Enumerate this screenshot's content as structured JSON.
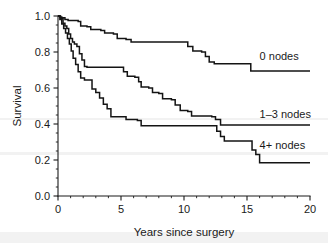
{
  "chart_data": {
    "type": "line",
    "subtype": "kaplan-meier-step",
    "title": "",
    "xlabel": "Years since surgery",
    "ylabel": "Survival",
    "xlim": [
      0,
      20
    ],
    "ylim": [
      0,
      1.0
    ],
    "grid": false,
    "legend_position": "inline-right",
    "x_ticks": [
      0,
      5,
      10,
      15,
      20
    ],
    "x_tick_labels": [
      "0",
      "5",
      "10",
      "15",
      "20"
    ],
    "x_minor_tick_interval": 1,
    "y_ticks": [
      0.0,
      0.2,
      0.4,
      0.6,
      0.8,
      1.0
    ],
    "y_tick_labels": [
      "0.0",
      "0.2",
      "0.4",
      "0.6",
      "0.8",
      "1.0"
    ],
    "y_minor_tick_interval": 0.05,
    "series": [
      {
        "name": "0 nodes",
        "label": "0 nodes",
        "color": "#141414",
        "label_x": 16.0,
        "label_y": 0.78,
        "steps": [
          [
            0.0,
            1.0
          ],
          [
            0.15,
            0.995
          ],
          [
            0.3,
            0.99
          ],
          [
            0.55,
            0.98
          ],
          [
            0.8,
            0.975
          ],
          [
            1.6,
            0.97
          ],
          [
            1.8,
            0.945
          ],
          [
            2.3,
            0.94
          ],
          [
            2.6,
            0.925
          ],
          [
            3.4,
            0.92
          ],
          [
            3.7,
            0.905
          ],
          [
            4.4,
            0.9
          ],
          [
            4.7,
            0.875
          ],
          [
            5.4,
            0.87
          ],
          [
            5.8,
            0.855
          ],
          [
            10.0,
            0.855
          ],
          [
            10.3,
            0.83
          ],
          [
            10.7,
            0.805
          ],
          [
            11.4,
            0.8
          ],
          [
            11.7,
            0.775
          ],
          [
            12.0,
            0.745
          ],
          [
            12.4,
            0.735
          ],
          [
            15.0,
            0.735
          ],
          [
            15.3,
            0.695
          ],
          [
            20.0,
            0.695
          ]
        ]
      },
      {
        "name": "1-3 nodes",
        "label": "1–3 nodes",
        "color": "#141414",
        "label_x": 16.0,
        "label_y": 0.455,
        "steps": [
          [
            0.0,
            1.0
          ],
          [
            0.2,
            0.985
          ],
          [
            0.4,
            0.96
          ],
          [
            0.55,
            0.945
          ],
          [
            0.7,
            0.93
          ],
          [
            0.85,
            0.9
          ],
          [
            1.0,
            0.875
          ],
          [
            1.15,
            0.855
          ],
          [
            1.3,
            0.845
          ],
          [
            1.5,
            0.83
          ],
          [
            1.7,
            0.79
          ],
          [
            1.9,
            0.755
          ],
          [
            2.1,
            0.72
          ],
          [
            2.3,
            0.715
          ],
          [
            5.0,
            0.715
          ],
          [
            5.2,
            0.69
          ],
          [
            5.5,
            0.665
          ],
          [
            6.1,
            0.66
          ],
          [
            6.4,
            0.635
          ],
          [
            6.6,
            0.605
          ],
          [
            7.2,
            0.6
          ],
          [
            7.5,
            0.575
          ],
          [
            8.0,
            0.57
          ],
          [
            8.3,
            0.54
          ],
          [
            9.0,
            0.535
          ],
          [
            9.3,
            0.505
          ],
          [
            9.7,
            0.475
          ],
          [
            10.3,
            0.47
          ],
          [
            10.6,
            0.445
          ],
          [
            12.2,
            0.44
          ],
          [
            12.5,
            0.425
          ],
          [
            12.9,
            0.395
          ],
          [
            20.0,
            0.395
          ]
        ]
      },
      {
        "name": "4+ nodes",
        "label": "4+ nodes",
        "color": "#141414",
        "label_x": 16.0,
        "label_y": 0.285,
        "steps": [
          [
            0.0,
            1.0
          ],
          [
            0.15,
            0.98
          ],
          [
            0.3,
            0.955
          ],
          [
            0.45,
            0.93
          ],
          [
            0.6,
            0.905
          ],
          [
            0.75,
            0.875
          ],
          [
            0.9,
            0.845
          ],
          [
            1.05,
            0.805
          ],
          [
            1.2,
            0.765
          ],
          [
            1.4,
            0.73
          ],
          [
            1.6,
            0.69
          ],
          [
            1.8,
            0.655
          ],
          [
            2.1,
            0.645
          ],
          [
            2.4,
            0.645
          ],
          [
            2.7,
            0.595
          ],
          [
            3.0,
            0.575
          ],
          [
            3.3,
            0.545
          ],
          [
            3.6,
            0.51
          ],
          [
            3.9,
            0.485
          ],
          [
            4.2,
            0.44
          ],
          [
            5.1,
            0.44
          ],
          [
            5.4,
            0.425
          ],
          [
            6.3,
            0.42
          ],
          [
            6.6,
            0.39
          ],
          [
            12.3,
            0.39
          ],
          [
            12.6,
            0.36
          ],
          [
            12.9,
            0.33
          ],
          [
            13.2,
            0.305
          ],
          [
            15.1,
            0.305
          ],
          [
            15.4,
            0.255
          ],
          [
            15.7,
            0.23
          ],
          [
            16.0,
            0.185
          ],
          [
            20.0,
            0.185
          ]
        ]
      }
    ]
  }
}
